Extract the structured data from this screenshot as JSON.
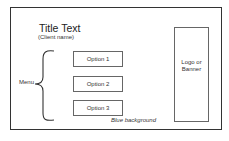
{
  "wireframe": {
    "title": "Title Text",
    "subtitle": "(Client name)",
    "menu": {
      "label": "Menu",
      "options": [
        {
          "label": "Option 1"
        },
        {
          "label": "Option 2"
        },
        {
          "label": "Option 3"
        }
      ]
    },
    "logo": {
      "line1": "Logo or",
      "line2": "Banner"
    },
    "background_note": "Blue background"
  },
  "colors": {
    "frame_border": "#333333",
    "box_border": "#666666",
    "text": "#222222"
  }
}
